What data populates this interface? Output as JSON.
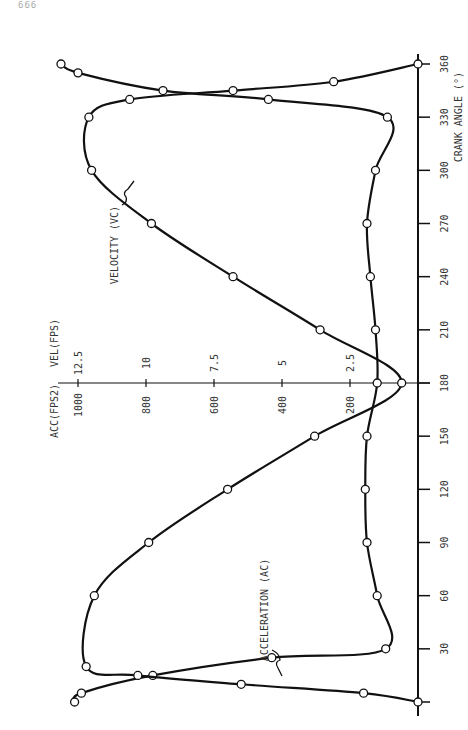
{
  "page": {
    "number": "666"
  },
  "chart_data": {
    "type": "line",
    "orientation": "rotated-90-ccw",
    "title": "",
    "xlabel": "CRANK ANGLE (°)",
    "ylabel": "ACC(FPS²)  VEL(FPS)",
    "x_ticks": [
      30,
      60,
      90,
      120,
      150,
      180,
      210,
      240,
      270,
      300,
      330,
      360
    ],
    "xlim": [
      0,
      360
    ],
    "acc_ticks": [
      200,
      400,
      600,
      800,
      1000
    ],
    "vel_ticks": [
      2.5,
      5,
      7.5,
      10,
      12.5
    ],
    "acc_label": "ACC(FPS",
    "acc_label_sup": "2",
    "acc_label_end": ")",
    "vel_label": "VEL(FPS)",
    "grid": false,
    "series": [
      {
        "name": "ACCELERATION (A_C)",
        "label": "ACCELERATION (A",
        "label_sub": "C",
        "label_end": ")",
        "unit": "FPS²",
        "points": [
          {
            "x": 0,
            "y": 1010
          },
          {
            "x": 5,
            "y": 990
          },
          {
            "x": 15,
            "y": 780
          },
          {
            "x": 25,
            "y": 430
          },
          {
            "x": 30,
            "y": 95
          },
          {
            "x": 60,
            "y": 120
          },
          {
            "x": 90,
            "y": 150
          },
          {
            "x": 120,
            "y": 155
          },
          {
            "x": 150,
            "y": 150
          },
          {
            "x": 180,
            "y": 120
          },
          {
            "x": 210,
            "y": 125
          },
          {
            "x": 240,
            "y": 140
          },
          {
            "x": 270,
            "y": 150
          },
          {
            "x": 300,
            "y": 125
          },
          {
            "x": 330,
            "y": 90
          },
          {
            "x": 340,
            "y": 440
          },
          {
            "x": 345,
            "y": 750
          },
          {
            "x": 355,
            "y": 1000
          },
          {
            "x": 360,
            "y": 1050
          }
        ]
      },
      {
        "name": "VELOCITY (V_C)",
        "label": "VELOCITY (V",
        "label_sub": "C",
        "label_end": ")",
        "unit": "FPS",
        "points": [
          {
            "x": 0,
            "y": 0.0
          },
          {
            "x": 5,
            "y": 2.0
          },
          {
            "x": 10,
            "y": 6.5
          },
          {
            "x": 15,
            "y": 10.3
          },
          {
            "x": 20,
            "y": 12.2
          },
          {
            "x": 60,
            "y": 11.9
          },
          {
            "x": 90,
            "y": 9.9
          },
          {
            "x": 120,
            "y": 7.0
          },
          {
            "x": 150,
            "y": 3.8
          },
          {
            "x": 180,
            "y": 0.6
          },
          {
            "x": 210,
            "y": 3.6
          },
          {
            "x": 240,
            "y": 6.8
          },
          {
            "x": 270,
            "y": 9.8
          },
          {
            "x": 300,
            "y": 12.0
          },
          {
            "x": 330,
            "y": 12.1
          },
          {
            "x": 340,
            "y": 10.6
          },
          {
            "x": 345,
            "y": 6.8
          },
          {
            "x": 350,
            "y": 3.1
          },
          {
            "x": 360,
            "y": 0.0
          }
        ]
      }
    ]
  }
}
